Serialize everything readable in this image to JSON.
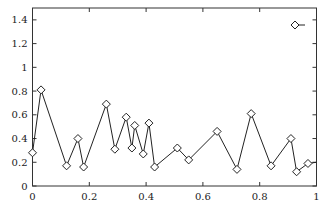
{
  "chart_data": {
    "type": "line",
    "title": "",
    "xlabel": "",
    "ylabel": "",
    "xlim": [
      0,
      1
    ],
    "ylim": [
      0,
      1.5
    ],
    "grid": false,
    "legend_position": "top-right",
    "x_ticks": [
      0,
      0.2,
      0.4,
      0.6,
      0.8,
      1
    ],
    "x_tick_labels": [
      "0",
      "0.2",
      "0.4",
      "0.6",
      "0.8",
      "1"
    ],
    "y_ticks": [
      0,
      0.2,
      0.4,
      0.6,
      0.8,
      1,
      1.2,
      1.4
    ],
    "y_tick_labels": [
      "0",
      "0.2",
      "0.4",
      "0.6",
      "0.8",
      "1",
      "1.2",
      "1.4"
    ],
    "series": [
      {
        "name": "",
        "marker": "diamond",
        "color": "#222222",
        "x": [
          0.0,
          0.03,
          0.12,
          0.16,
          0.18,
          0.26,
          0.29,
          0.33,
          0.35,
          0.36,
          0.39,
          0.41,
          0.43,
          0.51,
          0.55,
          0.65,
          0.72,
          0.77,
          0.84,
          0.91,
          0.93,
          0.97
        ],
        "values": [
          0.28,
          0.81,
          0.17,
          0.4,
          0.16,
          0.69,
          0.31,
          0.58,
          0.32,
          0.51,
          0.27,
          0.53,
          0.16,
          0.32,
          0.22,
          0.46,
          0.14,
          0.61,
          0.17,
          0.4,
          0.12,
          0.19
        ],
        "line_end": {
          "x": 1.0,
          "y": 0.2
        }
      }
    ]
  }
}
